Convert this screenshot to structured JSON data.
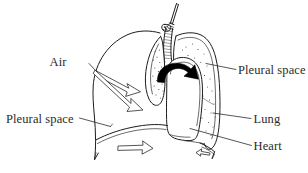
{
  "figure": {
    "background_color": "#ffffff",
    "ink_color": "#1c1c1c",
    "text_color": "#2b2b2b",
    "width": 308,
    "height": 173
  },
  "labels": {
    "air": "Air",
    "pleural_space_left": "Pleural space",
    "pleural_space_right": "Pleural space",
    "lung": "Lung",
    "heart": "Heart"
  },
  "structures": {
    "needle": "needle-icon",
    "trachea": "trachea-icon",
    "left_lung_collapsed": "collapsed-lung-icon",
    "right_lung": "lung-icon",
    "heart": "heart-icon",
    "diaphragm": "diaphragm-icon",
    "chest_wall": "chest-wall-icon"
  },
  "arrows": {
    "air_double": "double-headed-hollow-arrow",
    "air_lower": "hollow-arrow-down-right",
    "diaphragm": "hollow-arrow-right",
    "mediastinal_shift": "solid-black-curved-arrow",
    "small_lower_right": "small-hollow-arrow-left"
  }
}
